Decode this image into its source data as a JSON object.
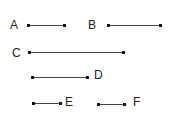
{
  "segments": [
    {
      "id": "A",
      "label": "A"
    },
    {
      "id": "B",
      "label": "B"
    },
    {
      "id": "C",
      "label": "C"
    },
    {
      "id": "D",
      "label": "D"
    },
    {
      "id": "E",
      "label": "E"
    },
    {
      "id": "F",
      "label": "F"
    }
  ],
  "colors": {
    "line": "#444444",
    "endpoint": "#111111",
    "text": "#222222",
    "background": "#ffffff"
  }
}
